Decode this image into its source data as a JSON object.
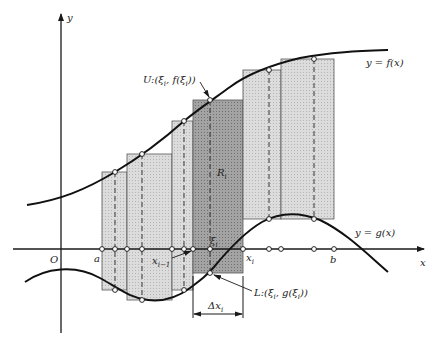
{
  "figure": {
    "axes": {
      "x_label": "x",
      "y_label": "y",
      "origin_label": "O"
    },
    "curves": {
      "upper": {
        "label": "y = f(x)"
      },
      "lower": {
        "label": "y = g(x)"
      }
    },
    "points": {
      "a_label": "a",
      "b_label": "b",
      "x_prev_label": "x",
      "x_prev_sub": "i−1",
      "x_i_label": "x",
      "x_i_sub": "i",
      "xi_label": "ξ",
      "xi_sub": "i"
    },
    "annotations": {
      "upper_point": "U:(ξ",
      "upper_point_sub": "i",
      "upper_point_mid": ", f(ξ",
      "upper_point_sub2": "i",
      "upper_point_end": "))",
      "lower_point": "L:(ξ",
      "lower_point_sub": "i",
      "lower_point_mid": ", g(ξ",
      "lower_point_sub2": "i",
      "lower_point_end": "))",
      "rect_label": "R",
      "rect_sub": "i",
      "delta_label": "Δx",
      "delta_sub": "i"
    },
    "colors": {
      "rect_fill": "#d6d6d6",
      "rect_highlight_fill": "#9a9a9a",
      "stroke": "#1a1a1a"
    },
    "rectangles": [
      {
        "x0": 102,
        "x1": 127,
        "xi": 115,
        "top": 172,
        "bottom": 290,
        "highlight": false
      },
      {
        "x0": 127,
        "x1": 172,
        "xi": 142,
        "top": 154,
        "bottom": 300,
        "highlight": false
      },
      {
        "x0": 172,
        "x1": 193,
        "xi": 184,
        "top": 121,
        "bottom": 290,
        "highlight": false
      },
      {
        "x0": 193,
        "x1": 243,
        "xi": 210,
        "top": 100,
        "bottom": 273,
        "highlight": true
      },
      {
        "x0": 243,
        "x1": 281,
        "xi": 269,
        "top": 70,
        "bottom": 219,
        "highlight": false
      },
      {
        "x0": 281,
        "x1": 334,
        "xi": 314,
        "top": 59,
        "bottom": 219,
        "highlight": false
      }
    ]
  }
}
